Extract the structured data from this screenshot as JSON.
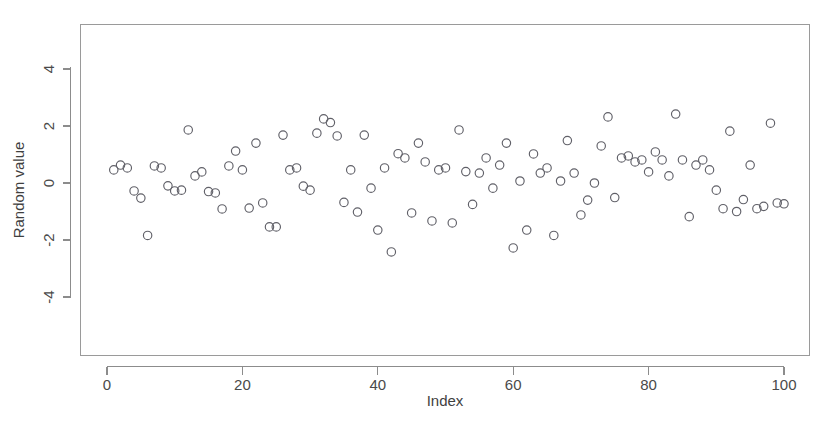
{
  "chart_data": {
    "type": "scatter",
    "title": "",
    "xlabel": "Index",
    "ylabel": "Random value",
    "xlim": [
      -1.5,
      103
    ],
    "ylim": [
      -5.2,
      5.3
    ],
    "xticks": [
      0,
      20,
      40,
      60,
      80,
      100
    ],
    "xticklabels": [
      "0",
      "20",
      "40",
      "60",
      "80",
      "100"
    ],
    "yticks": [
      -4,
      -2,
      0,
      2,
      4
    ],
    "yticklabels": [
      "-4",
      "-2",
      "0",
      "2",
      "4"
    ],
    "grid": false,
    "legend": false,
    "marker": "open-circle",
    "marker_color": "#606068",
    "marker_size": 4.2,
    "n_points": 100,
    "x": [
      1,
      2,
      3,
      4,
      5,
      6,
      7,
      8,
      9,
      10,
      11,
      12,
      13,
      14,
      15,
      16,
      17,
      18,
      19,
      20,
      21,
      22,
      23,
      24,
      25,
      26,
      27,
      28,
      29,
      30,
      31,
      32,
      33,
      34,
      35,
      36,
      37,
      38,
      39,
      40,
      41,
      42,
      43,
      44,
      45,
      46,
      47,
      48,
      49,
      50,
      51,
      52,
      53,
      54,
      55,
      56,
      57,
      58,
      59,
      60,
      61,
      62,
      63,
      64,
      65,
      66,
      67,
      68,
      69,
      70,
      71,
      72,
      73,
      74,
      75,
      76,
      77,
      78,
      79,
      80,
      81,
      82,
      83,
      84,
      85,
      86,
      87,
      88,
      89,
      90,
      91,
      92,
      93,
      94,
      95,
      96,
      97,
      98,
      99,
      100
    ],
    "y": [
      0.46,
      0.63,
      0.53,
      -0.28,
      -0.53,
      -1.84,
      0.6,
      0.53,
      -0.1,
      -0.28,
      -0.25,
      1.86,
      0.25,
      0.39,
      -0.3,
      -0.35,
      -0.91,
      0.6,
      1.12,
      0.46,
      -0.88,
      1.4,
      -0.7,
      -1.54,
      -1.54,
      1.68,
      0.46,
      0.53,
      -0.11,
      -0.25,
      1.75,
      2.25,
      2.12,
      1.65,
      -0.68,
      0.46,
      -1.02,
      1.68,
      -0.18,
      -1.65,
      0.53,
      -2.42,
      1.03,
      0.88,
      -1.05,
      1.4,
      0.74,
      -1.33,
      0.46,
      0.53,
      -1.4,
      1.86,
      0.4,
      -0.75,
      0.35,
      0.88,
      -0.18,
      0.63,
      1.4,
      -2.28,
      0.07,
      -1.65,
      1.02,
      0.35,
      0.53,
      -1.84,
      0.07,
      1.49,
      0.35,
      -1.12,
      -0.6,
      0.0,
      1.3,
      2.32,
      -0.51,
      0.88,
      0.95,
      0.74,
      0.81,
      0.39,
      1.09,
      0.81,
      0.25,
      2.42,
      0.81,
      -1.18,
      0.63,
      0.81,
      0.46,
      -0.25,
      -0.9,
      1.82,
      -1.0,
      -0.58,
      0.63,
      -0.9,
      -0.82,
      2.1,
      -0.7,
      -0.73
    ]
  }
}
